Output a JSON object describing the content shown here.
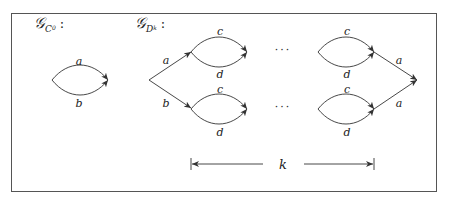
{
  "figure": {
    "graph_c0": {
      "title_main": "𝒢",
      "title_sub": "C",
      "title_subsub": "0",
      "colon": ":",
      "edge_labels": {
        "top": "a",
        "bottom": "b"
      }
    },
    "graph_dk": {
      "title_main": "𝒢",
      "title_sub": "D",
      "title_subsub": "k",
      "colon": ":",
      "edge_labels": {
        "start_upper": "a",
        "start_lower": "b",
        "lens_top": "c",
        "lens_bottom": "d",
        "end_upper": "a",
        "end_lower": "a"
      },
      "ellipsis": "···",
      "span_label": "k"
    }
  }
}
